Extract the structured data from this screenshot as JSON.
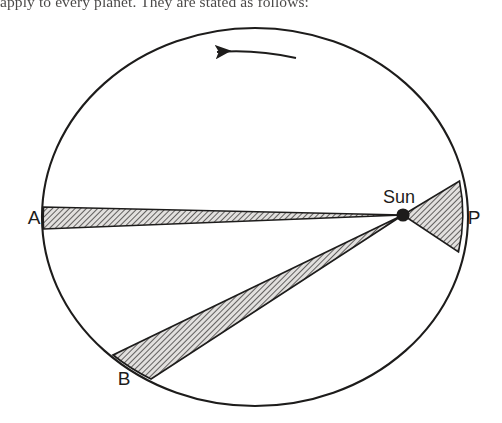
{
  "page": {
    "body_text_partial": "apply to every planet. They are stated as follows:"
  },
  "figure": {
    "name": "keplers-second-law-equal-areas-diagram",
    "background_color": "#ffffff",
    "stroke_color": "#1d1c1b",
    "hatch_color": "#4a4847",
    "hatch_fill": "#d8d6d4",
    "orbit": {
      "label": "orbit-ellipse",
      "center_x": 255,
      "center_y": 217,
      "radius_x": 213,
      "radius_y": 189
    },
    "direction_arrow": {
      "label": "counterclockwise-motion-arrow",
      "from_x": 295,
      "from_y": 57,
      "to_x": 215,
      "to_y": 52,
      "points": "left"
    },
    "sun": {
      "label": "Sun",
      "x": 403,
      "y": 215,
      "dot_radius": 6.5,
      "label_x": 399,
      "label_y": 202
    },
    "points": [
      {
        "id": "A",
        "label": "A",
        "x": 44,
        "y": 217,
        "label_x": 34,
        "label_y": 224
      },
      {
        "id": "P",
        "label": "P",
        "x": 468,
        "y": 217,
        "label_x": 473,
        "label_y": 224
      },
      {
        "id": "B",
        "label": "B",
        "x": 128,
        "y": 367,
        "label_x": 124,
        "label_y": 384
      }
    ],
    "sectors": [
      {
        "id": "sector-aphelion",
        "name": "swept-area-near-aphelion-A",
        "apex_x": 403,
        "apex_y": 215,
        "edge_start_x": 43,
        "edge_start_y": 207,
        "edge_end_x": 43,
        "edge_end_y": 229
      },
      {
        "id": "sector-perihelion",
        "name": "swept-area-near-perihelion-P",
        "apex_x": 403,
        "apex_y": 215,
        "edge_start_x": 459,
        "edge_start_y": 181,
        "edge_end_x": 458,
        "edge_end_y": 252
      },
      {
        "id": "sector-b",
        "name": "swept-area-near-point-B",
        "apex_x": 403,
        "apex_y": 215,
        "edge_start_x": 113,
        "edge_start_y": 355,
        "edge_end_x": 151,
        "edge_end_y": 379
      }
    ]
  }
}
